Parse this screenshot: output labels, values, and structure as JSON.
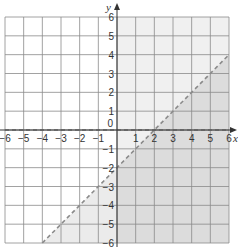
{
  "chart_data": {
    "type": "inequality-graph",
    "title": "",
    "xlabel": "x",
    "ylabel": "y",
    "xlim": [
      -6,
      6
    ],
    "ylim": [
      -6,
      6
    ],
    "grid": true,
    "x_ticks": [
      -6,
      -5,
      -4,
      -3,
      -2,
      -1,
      1,
      2,
      3,
      4,
      5,
      6
    ],
    "y_ticks": [
      6,
      5,
      4,
      3,
      2,
      1,
      -1,
      -2,
      -3,
      -4,
      -5,
      -6
    ],
    "origin_label": "0",
    "boundary_lines": [
      {
        "equation": "y = x - 2",
        "style": "dashed",
        "from": [
          -4,
          -6
        ],
        "to": [
          6,
          4
        ]
      },
      {
        "equation": "y = 0",
        "style": "dashed",
        "from": [
          -6,
          0
        ],
        "to": [
          6,
          0
        ]
      }
    ],
    "shaded_regions": [
      {
        "description": "x > 0 (right of y-axis)",
        "shade": "light"
      },
      {
        "description": "y < x - 2 (below dashed line)",
        "shade": "medium"
      }
    ]
  },
  "colors": {
    "grid": "#8a8a8a",
    "axis": "#333333",
    "light_shade": "#f0f0f0",
    "medium_shade": "#dcdcdc",
    "boundary": "#8a8a8a"
  }
}
